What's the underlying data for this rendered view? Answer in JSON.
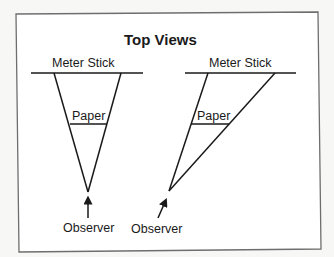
{
  "diagram": {
    "title": "Top Views",
    "left_view": {
      "stick_label": "Meter Stick",
      "paper_label": "Paper",
      "observer_label": "Observer"
    },
    "right_view": {
      "stick_label": "Meter Stick",
      "paper_label": "Paper",
      "observer_label": "Observer"
    },
    "colors": {
      "line": "#1a1a1a",
      "border": "#6e6e6e",
      "panel": "#ffffff",
      "background": "#f7f7f5"
    }
  }
}
